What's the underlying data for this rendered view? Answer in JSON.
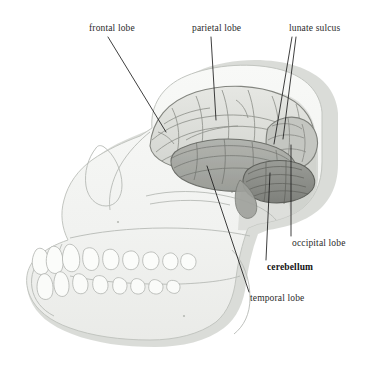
{
  "figure": {
    "background_color": "#ffffff"
  },
  "palette": {
    "background": "#ffffff",
    "skull_fill": "#f2f3f1",
    "skull_fill_light": "#f7f8f6",
    "skull_outline": "#b9bcb7",
    "skull_shadow": "#d8dad6",
    "drop_shadow": "#d2d4d0",
    "tooth_fill": "#fafbf9",
    "tooth_outline": "#b4b7b2",
    "cerebrum_fill": "#dedfdb",
    "cerebrum_outline": "#8d8f8b",
    "gyri_line": "#9b9d98",
    "temporal_fill": "#a9aba6",
    "temporal_outline": "#777974",
    "cerebellum_fill": "#8e908b",
    "cerebellum_outline": "#6b6d68",
    "occipital_fill": "#b8bab5",
    "occipital_shadow": "#7a7c77",
    "leader_line": "#1c1c1c",
    "label_text": "#2b2b2b",
    "label_text_bold": "#141414"
  },
  "labels": [
    {
      "id": "frontal-lobe",
      "text": "frontal lobe",
      "bold": false,
      "x": 89,
      "y": 23,
      "leader": {
        "x1": 108,
        "y1": 37,
        "x2": 166,
        "y2": 132
      }
    },
    {
      "id": "parietal-lobe",
      "text": "parietal lobe",
      "bold": false,
      "x": 192,
      "y": 23,
      "leader": {
        "x1": 211,
        "y1": 37,
        "x2": 216,
        "y2": 120
      }
    },
    {
      "id": "lunate-sulcus",
      "text": "lunate sulcus",
      "bold": false,
      "x": 289,
      "y": 23,
      "leaders": [
        {
          "x1": 292,
          "y1": 37,
          "x2": 274,
          "y2": 144
        },
        {
          "x1": 296,
          "y1": 37,
          "x2": 283,
          "y2": 139
        }
      ]
    },
    {
      "id": "occipital-lobe",
      "text": "occipital lobe",
      "bold": false,
      "x": 292,
      "y": 238,
      "leader": {
        "x1": 291,
        "y1": 236,
        "x2": 291,
        "y2": 145
      }
    },
    {
      "id": "cerebellum",
      "text": "cerebellum",
      "bold": true,
      "x": 267,
      "y": 262,
      "leader": {
        "x1": 266,
        "y1": 260,
        "x2": 270,
        "y2": 173
      }
    },
    {
      "id": "temporal-lobe",
      "text": "temporal lobe",
      "bold": false,
      "x": 250,
      "y": 293,
      "leader": {
        "x1": 249,
        "y1": 292,
        "x2": 207,
        "y2": 166
      }
    }
  ],
  "anatomy_regions": [
    {
      "id": "cerebrum",
      "name": "cerebrum (frontal + parietal)"
    },
    {
      "id": "temporal",
      "name": "temporal lobe"
    },
    {
      "id": "occipital",
      "name": "occipital lobe"
    },
    {
      "id": "cerebellum",
      "name": "cerebellum"
    },
    {
      "id": "skull",
      "name": "ape skull lateral view"
    },
    {
      "id": "mandible",
      "name": "mandible with dentition"
    }
  ]
}
